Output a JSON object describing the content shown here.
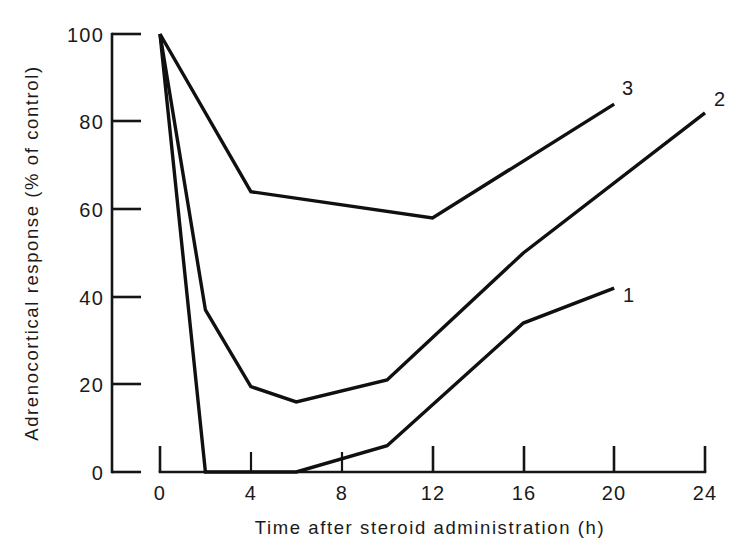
{
  "chart_data": {
    "type": "line",
    "title": "",
    "xlabel": "Time after steroid administration (h)",
    "ylabel": "Adrenocortical response (% of control)",
    "xlim": [
      0,
      24
    ],
    "ylim": [
      0,
      100
    ],
    "xticks": [
      0,
      4,
      8,
      12,
      16,
      20,
      24
    ],
    "xtick_labels": [
      "0",
      "4",
      "8",
      "12",
      "16",
      "20",
      "24"
    ],
    "yticks": [
      0,
      20,
      40,
      60,
      80,
      100
    ],
    "ytick_labels": [
      "0",
      "20",
      "40",
      "60",
      "80",
      "100"
    ],
    "grid": false,
    "legend_position": "line-end-labels",
    "series": [
      {
        "name": "1",
        "label": "1",
        "x": [
          0,
          2,
          6,
          10,
          16,
          20
        ],
        "y": [
          100,
          0,
          0,
          6,
          34,
          42
        ]
      },
      {
        "name": "2",
        "label": "2",
        "x": [
          0,
          2,
          4,
          6,
          10,
          16,
          24
        ],
        "y": [
          100,
          37,
          19.5,
          16,
          21,
          50,
          82
        ]
      },
      {
        "name": "3",
        "label": "3",
        "x": [
          0,
          4,
          12,
          20
        ],
        "y": [
          100,
          64,
          58,
          84
        ]
      }
    ],
    "annotations": [
      {
        "text": "3",
        "x": 20,
        "y": 84
      },
      {
        "text": "2",
        "x": 24,
        "y": 82
      },
      {
        "text": "1",
        "x": 20,
        "y": 42
      }
    ]
  },
  "colors": {
    "line": "#101010",
    "axis": "#151515",
    "background": "#ffffff",
    "text": "#1a1a1a"
  }
}
